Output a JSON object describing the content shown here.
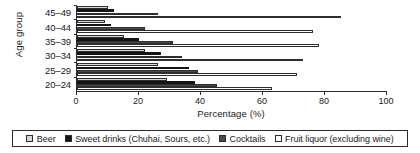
{
  "chart_data": {
    "type": "bar",
    "orientation": "horizontal",
    "title": "",
    "xlabel": "Percentage (%)",
    "ylabel": "Age group",
    "xlim": [
      0,
      100
    ],
    "xticks": [
      0,
      20,
      40,
      60,
      80,
      100
    ],
    "xtick_labels": [
      "0",
      "20",
      "40",
      "60",
      "80",
      "100"
    ],
    "grid": false,
    "legend_position": "bottom",
    "categories": [
      "45–49",
      "40–44",
      "35–39",
      "30–34",
      "25–29",
      "20–24"
    ],
    "series": [
      {
        "name": "Beer",
        "swatch": "#d8d8d8",
        "values": [
          10,
          9,
          15,
          22,
          26,
          29
        ]
      },
      {
        "name": "Sweet drinks (Chuhai, Sours, etc.)",
        "swatch": "#151515",
        "values": [
          12,
          11,
          20,
          27,
          36,
          38
        ]
      },
      {
        "name": "Cocktails",
        "swatch": "#4a4a4a",
        "values": [
          26,
          22,
          31,
          34,
          39,
          45
        ]
      },
      {
        "name": "Fruit liquor (excluding wine)",
        "swatch": "#ffffff",
        "values": [
          85,
          76,
          78,
          73,
          71,
          63
        ]
      }
    ]
  },
  "axes": {
    "y_title": "Age group",
    "x_title": "Percentage (%)"
  },
  "legend": {
    "items": [
      {
        "label": "Beer"
      },
      {
        "label": "Sweet drinks (Chuhai, Sours, etc.)"
      },
      {
        "label": "Cocktails"
      },
      {
        "label": "Fruit liquor (excluding wine)"
      }
    ]
  }
}
